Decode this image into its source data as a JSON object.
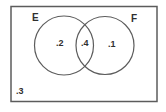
{
  "diagram": {
    "type": "venn",
    "sets": [
      {
        "label": "E",
        "only_value": ".2"
      },
      {
        "label": "F",
        "only_value": ".1"
      }
    ],
    "intersection_value": ".4",
    "outside_value": ".3",
    "colors": {
      "stroke": "#5c5c5c",
      "text": "#2f2f2f",
      "background": "#ffffff"
    }
  }
}
